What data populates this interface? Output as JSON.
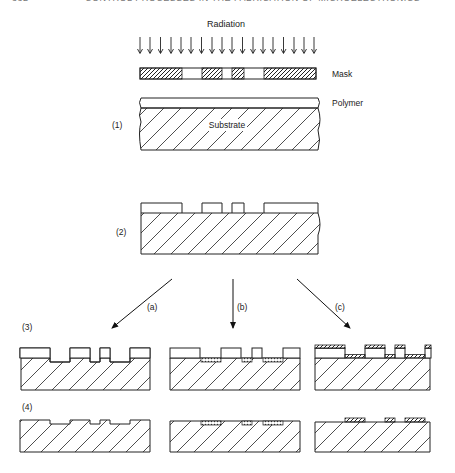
{
  "page_header": {
    "page_number": "332",
    "running_title": "CONTROL PROCESSES IN THE FABRICATION OF MICROELECTRONICS"
  },
  "labels": {
    "radiation": "Radiation",
    "mask": "Mask",
    "polymer": "Polymer",
    "substrate": "Substrate"
  },
  "steps": {
    "step1": "(1)",
    "step2": "(2)",
    "step3": "(3)",
    "step4": "(4)"
  },
  "branches": {
    "a": "(a)",
    "b": "(b)",
    "c": "(c)"
  },
  "diagram": {
    "radiation_arrow_count": 18,
    "mask_segments": [
      "opaque",
      "open",
      "opaque",
      "open",
      "opaque",
      "open",
      "opaque"
    ],
    "colors": {
      "line": "#222222",
      "background": "#ffffff"
    }
  }
}
